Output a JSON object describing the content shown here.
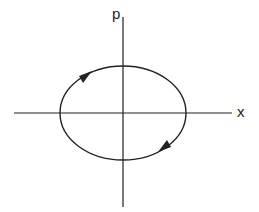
{
  "diagram": {
    "type": "phase-space-orbit",
    "axes": {
      "horizontal_label": "x",
      "vertical_label": "p"
    },
    "orbit": {
      "shape": "ellipse",
      "direction": "clockwise",
      "arrows": [
        "upper-left",
        "lower-right"
      ]
    },
    "colors": {
      "line": "#222222",
      "background": "#ffffff"
    }
  }
}
